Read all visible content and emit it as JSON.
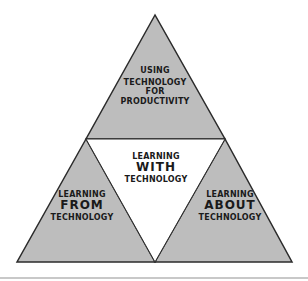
{
  "diagram": {
    "type": "triangle-of-triangles",
    "colors": {
      "shaded": "#bdbdbd",
      "outline": "#2b2b2b",
      "center": "#ffffff",
      "text": "#1a1a1a"
    },
    "segments": {
      "top": {
        "lines": [
          "USING",
          "TECHNOLOGY",
          "FOR",
          "PRODUCTIVITY"
        ]
      },
      "center": {
        "lines": [
          "LEARNING",
          "WITH",
          "TECHNOLOGY"
        ]
      },
      "bottom_left": {
        "lines": [
          "LEARNING",
          "FROM",
          "TECHNOLOGY"
        ]
      },
      "bottom_right": {
        "lines": [
          "LEARNING",
          "ABOUT",
          "TECHNOLOGY"
        ]
      }
    }
  }
}
